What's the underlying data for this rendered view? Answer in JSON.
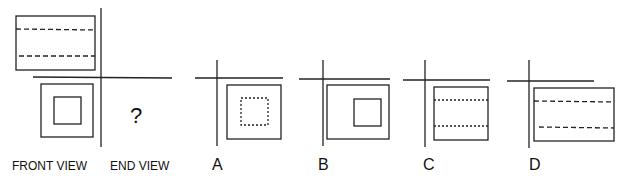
{
  "diagram": {
    "type": "orthographic-projection-question",
    "question_mark": "?",
    "labels": {
      "front_view": "FRONT VIEW",
      "end_view": "END VIEW"
    },
    "options": [
      {
        "label": "A",
        "description": "square with dotted inner square"
      },
      {
        "label": "B",
        "description": "wide rectangle with solid inner square"
      },
      {
        "label": "C",
        "description": "square with two dotted horizontal lines"
      },
      {
        "label": "D",
        "description": "wide rectangle with two dashed horizontal lines"
      }
    ],
    "colors": {
      "stroke": "#222222",
      "background": "#ffffff"
    }
  }
}
